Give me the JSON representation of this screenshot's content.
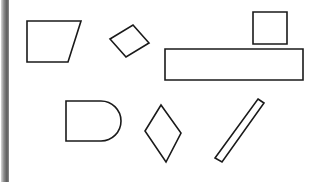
{
  "canvas": {
    "width": 317,
    "height": 182,
    "background_color": "#ffffff",
    "title": "geometric-shapes-scene"
  },
  "palette": {
    "outline_color": "#1a1a1a",
    "fill_color": "#ffffff",
    "strip_light": "#d8d8d8",
    "strip_mid": "#8d8d8d",
    "strip_dark": "#5a5a5a"
  },
  "edge_strip": {
    "name": "left-vertical-gradient-strip",
    "x": 1,
    "y": 0,
    "width": 8,
    "height": 182,
    "orientation": "vertical"
  },
  "shapes": [
    {
      "id": "trapezoid",
      "label": "trapezoid",
      "kind": "polygon",
      "points": "27,21 81,21 68,62 27,62",
      "stroke_width": 1.6
    },
    {
      "id": "small-rotated-rectangle",
      "label": "small rotated rectangle",
      "kind": "polygon",
      "points": "110,39 133,25 149,43 126,57",
      "stroke_width": 1.6
    },
    {
      "id": "square",
      "label": "square",
      "kind": "polygon",
      "points": "253,12 287,12 287,44 253,44",
      "stroke_width": 1.6
    },
    {
      "id": "long-horizontal-rectangle",
      "label": "long horizontal rectangle",
      "kind": "polygon",
      "points": "165,49 303,49 303,80 165,80",
      "stroke_width": 1.6
    },
    {
      "id": "rounded-rectangle",
      "label": "rectangle with rounded right end",
      "kind": "path",
      "d": "M 66,101 L 101,101 A 20 20 0 0 1 101,141 L 66,141 Z",
      "stroke_width": 1.6
    },
    {
      "id": "rhombus",
      "label": "rhombus",
      "kind": "polygon",
      "points": "161,105 181,133 166,162 145,131",
      "stroke_width": 1.6
    },
    {
      "id": "slanted-bar",
      "label": "thin slanted bar",
      "kind": "polygon",
      "points": "258,99 264,103 222,162 215,158",
      "stroke_width": 1.6
    }
  ]
}
